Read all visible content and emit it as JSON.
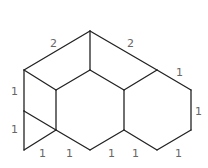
{
  "diagram": {
    "type": "geometric-figure",
    "vertices": {
      "A": [
        90,
        31
      ],
      "B": [
        24,
        70
      ],
      "C": [
        90,
        70
      ],
      "D": [
        56,
        90
      ],
      "E": [
        124,
        90
      ],
      "F": [
        157,
        70
      ],
      "G": [
        191,
        90
      ],
      "H": [
        191,
        130
      ],
      "I": [
        157,
        150
      ],
      "J": [
        124,
        130
      ],
      "K": [
        90,
        150
      ],
      "L": [
        56,
        130
      ],
      "M": [
        24,
        111
      ],
      "N": [
        24,
        150
      ]
    },
    "edges": [
      [
        "A",
        "B"
      ],
      [
        "A",
        "C"
      ],
      [
        "A",
        "F"
      ],
      [
        "B",
        "D"
      ],
      [
        "B",
        "M"
      ],
      [
        "M",
        "N"
      ],
      [
        "M",
        "L"
      ],
      [
        "N",
        "L"
      ],
      [
        "D",
        "L"
      ],
      [
        "D",
        "C"
      ],
      [
        "C",
        "E"
      ],
      [
        "E",
        "F"
      ],
      [
        "E",
        "J"
      ],
      [
        "F",
        "G"
      ],
      [
        "G",
        "H"
      ],
      [
        "H",
        "I"
      ],
      [
        "I",
        "J"
      ],
      [
        "J",
        "K"
      ],
      [
        "K",
        "L"
      ]
    ],
    "labels": [
      {
        "text": "2",
        "x": 50,
        "y": 47
      },
      {
        "text": "2",
        "x": 127,
        "y": 47
      },
      {
        "text": "1",
        "x": 176,
        "y": 76
      },
      {
        "text": "1",
        "x": 195,
        "y": 115
      },
      {
        "text": "1",
        "x": 11,
        "y": 95
      },
      {
        "text": "1",
        "x": 11,
        "y": 133
      },
      {
        "text": "1",
        "x": 39,
        "y": 157
      },
      {
        "text": "1",
        "x": 66,
        "y": 157
      },
      {
        "text": "1",
        "x": 108,
        "y": 157
      },
      {
        "text": "1",
        "x": 132,
        "y": 157
      },
      {
        "text": "1",
        "x": 175,
        "y": 157
      }
    ]
  }
}
